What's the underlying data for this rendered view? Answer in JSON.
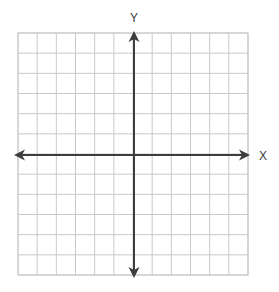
{
  "figure": {
    "title": "",
    "background_color": "#ffffff",
    "width": 279,
    "height": 292
  },
  "chart_data": {
    "type": "scatter",
    "title": "",
    "subtitle": "",
    "xlabel": "X",
    "ylabel": "Y",
    "series": [],
    "x": [],
    "values": [],
    "xlim": [
      -6,
      6
    ],
    "ylim": [
      -6,
      6
    ],
    "xticks": [
      -6,
      -5,
      -4,
      -3,
      -2,
      -1,
      0,
      1,
      2,
      3,
      4,
      5,
      6
    ],
    "yticks": [
      -6,
      -5,
      -4,
      -3,
      -2,
      -1,
      0,
      1,
      2,
      3,
      4,
      5,
      6
    ],
    "xtick_labels": [],
    "ytick_labels": [],
    "grid": true,
    "grid_columns": 12,
    "grid_rows": 12,
    "legend": false,
    "legend_position": "none",
    "annotations": []
  },
  "grid": {
    "columns": 12,
    "rows": 12,
    "left": 18,
    "top": 33,
    "right": 248,
    "bottom": 275,
    "cell_width": 19.17,
    "cell_height": 20.17,
    "line_color": "#c9c9c9",
    "line_width": 1,
    "border_color": "#c9c9c9"
  },
  "axes": {
    "color": "#3d3d3d",
    "line_width": 2,
    "origin_x": 134,
    "origin_y": 155,
    "x_axis": {
      "label": "X",
      "label_x": 263,
      "label_y": 160,
      "start_x": 14,
      "end_x": 250,
      "y": 155,
      "arrow_start": true,
      "arrow_end": true
    },
    "y_axis": {
      "label": "Y",
      "label_x": 134,
      "label_y": 22,
      "x": 134,
      "start_y": 31,
      "end_y": 278,
      "arrow_start": true,
      "arrow_end": true
    }
  }
}
